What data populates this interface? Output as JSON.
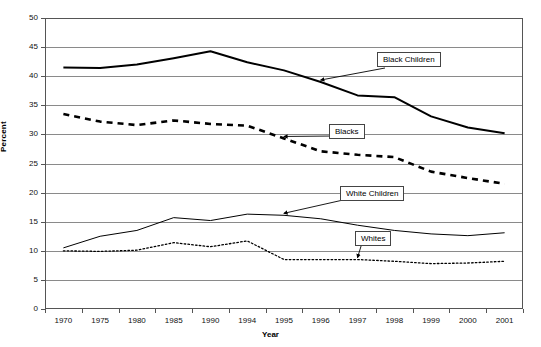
{
  "chart_data": {
    "type": "line",
    "title": "",
    "xlabel": "Year",
    "ylabel": "Percent",
    "ylim": [
      0,
      50
    ],
    "ytick_step": 5,
    "yticks": [
      50,
      45,
      40,
      35,
      30,
      25,
      20,
      15,
      10,
      5,
      0
    ],
    "grid": true,
    "legend": "annotations",
    "categories": [
      "1970",
      "1975",
      "1980",
      "1985",
      "1990",
      "1994",
      "1995",
      "1996",
      "1997",
      "1998",
      "1999",
      "2000",
      "2001"
    ],
    "series": [
      {
        "name": "Black Children",
        "style": "solid-thick",
        "color": "#000000",
        "values": [
          41.5,
          41.4,
          42.0,
          43.1,
          44.3,
          42.4,
          41.0,
          39.0,
          36.7,
          36.4,
          33.1,
          31.2,
          30.2
        ]
      },
      {
        "name": "Blacks",
        "style": "dashed",
        "color": "#000000",
        "values": [
          33.5,
          32.2,
          31.6,
          32.4,
          31.8,
          31.5,
          29.3,
          27.1,
          26.5,
          26.1,
          23.6,
          22.5,
          21.5
        ]
      },
      {
        "name": "White Children",
        "style": "solid-thin",
        "color": "#000000",
        "values": [
          10.5,
          12.5,
          13.5,
          15.7,
          15.2,
          16.3,
          16.1,
          15.5,
          14.4,
          13.5,
          12.9,
          12.6,
          13.1
        ]
      },
      {
        "name": "Whites",
        "style": "dotted",
        "color": "#000000",
        "values": [
          10.0,
          9.9,
          10.1,
          11.4,
          10.7,
          11.7,
          8.5,
          8.5,
          8.5,
          8.2,
          7.8,
          7.9,
          8.2
        ]
      }
    ],
    "annotations": [
      {
        "label": "Black Children",
        "points_to_series": "Black Children",
        "points_to_category": "1996"
      },
      {
        "label": "Blacks",
        "points_to_series": "Blacks",
        "points_to_category": "1995"
      },
      {
        "label": "White Children",
        "points_to_series": "White Children",
        "points_to_category": "1995"
      },
      {
        "label": "Whites",
        "points_to_series": "Whites",
        "points_to_category": "1997"
      }
    ]
  },
  "axes": {
    "y_title": "Percent",
    "x_title": "Year",
    "y_labels": [
      "50",
      "45",
      "40",
      "35",
      "30",
      "25",
      "20",
      "15",
      "10",
      "5",
      "0"
    ],
    "x_labels": [
      "1970",
      "1975",
      "1980",
      "1985",
      "1990",
      "1994",
      "1995",
      "1996",
      "1997",
      "1998",
      "1999",
      "2000",
      "2001"
    ]
  },
  "callouts": {
    "black_children": "Black Children",
    "blacks": "Blacks",
    "white_children": "White Children",
    "whites": "Whites"
  }
}
